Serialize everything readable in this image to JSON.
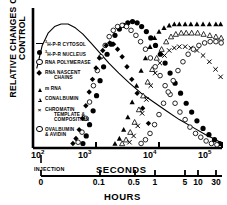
{
  "figure": {
    "ylabel_line1": "RELATIVE CHANGES OVER",
    "ylabel_line2": "CONTROL",
    "seconds_axis_name": "SECONDS",
    "hours_axis_name": "HOURS",
    "injection_label": "INJECTION"
  },
  "legend": {
    "items": [
      {
        "marker": "dash",
        "sup": "3",
        "text": "H-P-R CYTOSOL",
        "text2": ""
      },
      {
        "marker": "filled-circle",
        "sup": "3",
        "text": "H-P-R  NUCLEUS",
        "text2": ""
      },
      {
        "marker": "open-circle",
        "sup": "",
        "text": "RNA POLYMERASE",
        "text2": ""
      },
      {
        "marker": "filled-diamond",
        "sup": "",
        "text": "RNA NASCENT",
        "text2": "CHAINS"
      },
      {
        "marker": "filled-triangle",
        "sup": "",
        "text": "m RNA",
        "text2": ""
      },
      {
        "marker": "open-triangle",
        "sup": "",
        "text": "CONALBUMIN",
        "text2": ""
      },
      {
        "marker": "x",
        "sup": "",
        "text": "CHROMATIN",
        "text2": "TEMPLATE &|COMPOSITION"
      },
      {
        "marker": "open-circle",
        "sup": "",
        "text": "OVALBUMIN",
        "text2": "& AVIDIN"
      }
    ]
  },
  "axes": {
    "seconds_ticks": [
      {
        "base": "10",
        "exp": "2",
        "x": 33
      },
      {
        "base": "10",
        "exp": "3",
        "x": 80
      },
      {
        "base": "10",
        "exp": "4",
        "x": 145
      },
      {
        "base": "10",
        "exp": "5",
        "x": 200
      }
    ],
    "hours_ticks": [
      {
        "label": "0",
        "x": 41
      },
      {
        "label": "0.1",
        "x": 100
      },
      {
        "label": "0.5",
        "x": 135
      },
      {
        "label": "1",
        "x": 155
      },
      {
        "label": "5",
        "x": 185
      },
      {
        "label": "10",
        "x": 198
      },
      {
        "label": "30",
        "x": 216
      }
    ]
  },
  "chart_data": {
    "type": "scatter",
    "title": "",
    "xlabel": "SECONDS / HOURS",
    "ylabel": "RELATIVE CHANGES OVER CONTROL",
    "xscale": "log",
    "xlim": [
      100,
      100000
    ],
    "ylim": [
      0,
      1.05
    ],
    "grid": false,
    "legend_position": "inside-left",
    "x_axis_secondary": {
      "name": "HOURS",
      "ticks": [
        0,
        0.1,
        0.5,
        1,
        5,
        10,
        30
      ]
    },
    "x_axis_primary": {
      "name": "SECONDS",
      "ticks": [
        100,
        1000,
        10000,
        100000
      ]
    },
    "annotations": [
      "INJECTION at 10^2 seconds / 0 hours"
    ],
    "series": [
      {
        "name": "3H-P-R CYTOSOL",
        "marker": "line",
        "x": [
          115,
          140,
          175,
          220,
          280,
          360,
          470,
          620,
          830,
          1150,
          1600,
          2300,
          3400,
          5200,
          8200,
          13000,
          21000,
          34000,
          55000,
          80000,
          100000
        ],
        "y": [
          0.62,
          0.8,
          0.9,
          0.95,
          0.97,
          0.97,
          0.94,
          0.89,
          0.82,
          0.74,
          0.66,
          0.58,
          0.5,
          0.42,
          0.35,
          0.28,
          0.21,
          0.15,
          0.09,
          0.05,
          0.02
        ]
      },
      {
        "name": "3H-P-R NUCLEUS",
        "marker": "filled-circle",
        "x": [
          620,
          700,
          790,
          900,
          1020,
          1160,
          1320,
          1500,
          1750,
          2000,
          2350,
          2750,
          3200,
          3800,
          4500,
          5300,
          6300,
          7400,
          8800,
          10500,
          12500,
          15000,
          18000,
          22000,
          27000,
          33000,
          40000,
          50000,
          62000,
          76000,
          92000
        ],
        "y": [
          0.02,
          0.08,
          0.17,
          0.28,
          0.4,
          0.52,
          0.63,
          0.73,
          0.81,
          0.88,
          0.93,
          0.96,
          0.98,
          0.99,
          0.98,
          0.95,
          0.91,
          0.86,
          0.8,
          0.73,
          0.66,
          0.58,
          0.5,
          0.42,
          0.34,
          0.27,
          0.2,
          0.14,
          0.09,
          0.05,
          0.02
        ]
      },
      {
        "name": "RNA POLYMERASE",
        "marker": "open-circle",
        "x": [
          520,
          600,
          690,
          790,
          910,
          1050,
          1200,
          1400,
          1620,
          1880,
          2200,
          2600,
          3050,
          3600,
          4300,
          5100,
          6100,
          7300,
          8700,
          10400,
          12500,
          15000,
          18000,
          21500,
          26000,
          31000,
          38000,
          46000,
          56000,
          68000,
          83000
        ],
        "y": [
          0.03,
          0.11,
          0.22,
          0.35,
          0.48,
          0.6,
          0.71,
          0.8,
          0.87,
          0.92,
          0.95,
          0.96,
          0.95,
          0.92,
          0.88,
          0.83,
          0.77,
          0.7,
          0.63,
          0.56,
          0.48,
          0.41,
          0.34,
          0.27,
          0.21,
          0.15,
          0.1,
          0.07,
          0.04,
          0.02,
          0.01
        ]
      },
      {
        "name": "RNA NASCENT CHAINS",
        "marker": "filled-diamond",
        "x": [
          430,
          480,
          540,
          610,
          690,
          780,
          880,
          1000,
          1130,
          1280,
          1450,
          1650,
          1900,
          2200,
          2600,
          3100,
          3700,
          4500,
          5500,
          6800
        ],
        "y": [
          0.02,
          0.06,
          0.13,
          0.22,
          0.32,
          0.43,
          0.53,
          0.62,
          0.7,
          0.76,
          0.8,
          0.82,
          0.81,
          0.77,
          0.71,
          0.63,
          0.53,
          0.42,
          0.3,
          0.18
        ]
      },
      {
        "name": "m RNA",
        "marker": "filled-triangle",
        "x": [
          2000,
          2350,
          2750,
          3200,
          3750,
          4400,
          5200,
          6100,
          7200,
          8500,
          10000,
          12000,
          14500,
          17500,
          21000,
          26000,
          32000,
          40000,
          50000,
          63000,
          80000,
          95000
        ],
        "y": [
          0.02,
          0.06,
          0.13,
          0.23,
          0.35,
          0.48,
          0.6,
          0.7,
          0.79,
          0.86,
          0.91,
          0.94,
          0.96,
          0.97,
          0.97,
          0.97,
          0.97,
          0.97,
          0.97,
          0.97,
          0.97,
          0.97
        ]
      },
      {
        "name": "CONALBUMIN",
        "marker": "open-triangle",
        "x": [
          2600,
          3000,
          3500,
          4100,
          4800,
          5600,
          6600,
          7800,
          9200,
          11000,
          13000,
          15500,
          18500,
          22500,
          27000,
          33000,
          41000,
          51000,
          64000,
          80000,
          97000
        ],
        "y": [
          0.02,
          0.05,
          0.11,
          0.19,
          0.29,
          0.4,
          0.51,
          0.61,
          0.7,
          0.77,
          0.83,
          0.87,
          0.89,
          0.9,
          0.9,
          0.9,
          0.9,
          0.89,
          0.88,
          0.87,
          0.86
        ]
      },
      {
        "name": "CHROMATIN TEMPLATE & COMPOSITION",
        "marker": "x",
        "x": [
          3400,
          3950,
          4600,
          5400,
          6300,
          7400,
          8700,
          10300,
          12200,
          14500,
          17500,
          21000,
          26000,
          32000,
          40000,
          50000,
          63000,
          79000,
          95000
        ],
        "y": [
          0.03,
          0.08,
          0.16,
          0.26,
          0.37,
          0.48,
          0.58,
          0.66,
          0.72,
          0.76,
          0.78,
          0.79,
          0.79,
          0.78,
          0.76,
          0.72,
          0.67,
          0.61,
          0.55
        ]
      },
      {
        "name": "OVALBUMIN & AVIDIN",
        "marker": "open-circle",
        "x": [
          5200,
          6100,
          7200,
          8500,
          10000,
          11800,
          14000,
          16800,
          20000,
          24000,
          29000,
          35000,
          43000,
          53000,
          65000,
          80000,
          97000
        ],
        "y": [
          0.02,
          0.05,
          0.1,
          0.17,
          0.25,
          0.34,
          0.43,
          0.52,
          0.6,
          0.67,
          0.73,
          0.77,
          0.8,
          0.82,
          0.83,
          0.83,
          0.82
        ]
      }
    ]
  }
}
